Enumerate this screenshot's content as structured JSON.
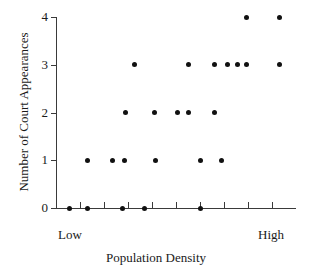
{
  "chart_data": {
    "type": "scatter",
    "title": "",
    "xlabel": "Population Density",
    "ylabel": "Number of Court Appearances",
    "x_tick_labels": [
      "Low",
      "High"
    ],
    "y_tick_labels": [
      "0",
      "1",
      "2",
      "3",
      "4"
    ],
    "ylim": [
      0,
      4
    ],
    "xlim": [
      0,
      10
    ],
    "grid": false,
    "legend": null,
    "x_axis_is_ordinal": true,
    "x_tick_positions": [
      1,
      2,
      3,
      4,
      5,
      6,
      7,
      8,
      9
    ],
    "points": [
      {
        "x": 0.55,
        "y": 0
      },
      {
        "x": 1.3,
        "y": 0
      },
      {
        "x": 2.78,
        "y": 0
      },
      {
        "x": 3.7,
        "y": 0
      },
      {
        "x": 6.03,
        "y": 0
      },
      {
        "x": 1.3,
        "y": 1
      },
      {
        "x": 2.35,
        "y": 1
      },
      {
        "x": 2.87,
        "y": 1
      },
      {
        "x": 4.16,
        "y": 1
      },
      {
        "x": 6.03,
        "y": 1
      },
      {
        "x": 6.9,
        "y": 1
      },
      {
        "x": 2.9,
        "y": 2
      },
      {
        "x": 4.12,
        "y": 2
      },
      {
        "x": 5.08,
        "y": 2
      },
      {
        "x": 5.5,
        "y": 2
      },
      {
        "x": 6.62,
        "y": 2
      },
      {
        "x": 3.28,
        "y": 3
      },
      {
        "x": 5.5,
        "y": 3
      },
      {
        "x": 6.62,
        "y": 3
      },
      {
        "x": 7.15,
        "y": 3
      },
      {
        "x": 7.58,
        "y": 3
      },
      {
        "x": 7.95,
        "y": 3
      },
      {
        "x": 9.3,
        "y": 3
      },
      {
        "x": 7.95,
        "y": 4
      },
      {
        "x": 9.3,
        "y": 4
      }
    ]
  },
  "axis": {
    "x_low_label": "Low",
    "x_high_label": "High",
    "x_title": "Population Density",
    "y_title": "Number of Court Appearances"
  },
  "colors": {
    "point": "#111111",
    "axis": "#3a3a3a",
    "text": "#1a1a1a",
    "background": "#ffffff"
  }
}
